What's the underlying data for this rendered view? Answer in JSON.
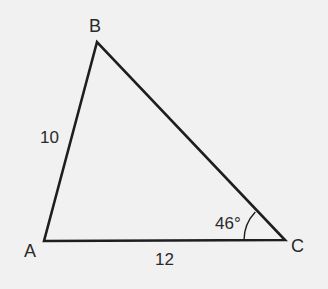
{
  "figure": {
    "type": "triangle",
    "vertices": [
      {
        "id": "A",
        "label": "A",
        "x": 44,
        "y": 241
      },
      {
        "id": "B",
        "label": "B",
        "x": 97,
        "y": 42
      },
      {
        "id": "C",
        "label": "C",
        "x": 285,
        "y": 240
      }
    ],
    "sides": [
      {
        "from": "A",
        "to": "B",
        "label": "10"
      },
      {
        "from": "A",
        "to": "C",
        "label": "12"
      },
      {
        "from": "B",
        "to": "C",
        "label": ""
      }
    ],
    "angles": [
      {
        "at": "C",
        "label": "46°"
      }
    ],
    "colors": {
      "background": "#f1f1f1",
      "stroke": "#1e1e1e",
      "text": "#2a2a2a"
    }
  }
}
